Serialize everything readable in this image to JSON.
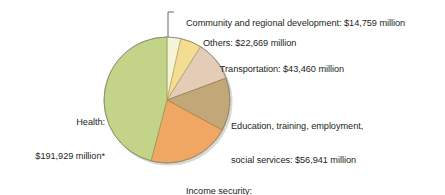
{
  "figure": {
    "type": "pie-chart-figure",
    "background_color": "#ffffff",
    "text_color": "#231f20"
  },
  "chart_data": {
    "type": "pie",
    "title": "",
    "subtitle": "",
    "xlabel": "",
    "ylabel": "",
    "units": "million",
    "currency": "$",
    "total": 418091,
    "legend_position": "callout-labels",
    "grid": false,
    "start_angle_deg": 0,
    "direction": "clockwise",
    "categories": [
      "Community and regional development",
      "Others",
      "Transportation",
      "Education, training, employment, social services",
      "Income security",
      "Health"
    ],
    "values": [
      14759,
      22669,
      43460,
      56941,
      88333,
      191929
    ],
    "colors": [
      "#f5f3d8",
      "#f2dd92",
      "#e3cdb6",
      "#c2a878",
      "#f0a763",
      "#c3d488"
    ],
    "slices": [
      {
        "name": "community-and-regional-development",
        "label_line1": "Community and regional development: $14,759 million",
        "label_line2": "",
        "value": 14759,
        "value_text": "$14,759 million",
        "percent": 3.5,
        "angle_deg": 12.71,
        "color": "#f5f3d8"
      },
      {
        "name": "others",
        "label_line1": "Others: $22,669 million",
        "label_line2": "",
        "value": 22669,
        "value_text": "$22,669 million",
        "percent": 5.4,
        "angle_deg": 19.52,
        "color": "#f2dd92"
      },
      {
        "name": "transportation",
        "label_line1": "Transportation: $43,460 million",
        "label_line2": "",
        "value": 43460,
        "value_text": "$43,460 million",
        "percent": 10.4,
        "angle_deg": 37.43,
        "color": "#e3cdb6"
      },
      {
        "name": "education-training-employment-social-services",
        "label_line1": "Education, training, employment,",
        "label_line2": "social services: $56,941 million",
        "value": 56941,
        "value_text": "$56,941 million",
        "percent": 13.6,
        "angle_deg": 49.04,
        "color": "#c2a878"
      },
      {
        "name": "income-security",
        "label_line1": "Income security:",
        "label_line2": "$88,333 million",
        "value": 88333,
        "value_text": "$88,333 million",
        "percent": 21.1,
        "angle_deg": 76.08,
        "color": "#f0a763"
      },
      {
        "name": "health",
        "label_line1": "Health:",
        "label_line2": "$191,929 million*",
        "value": 191929,
        "value_text": "$191,929 million*",
        "percent": 45.9,
        "angle_deg": 165.23,
        "color": "#c3d488"
      }
    ]
  },
  "labels": {
    "community": "Community and regional development: $14,759 million",
    "others": "Others: $22,669 million",
    "transportation": "Transportation: $43,460 million",
    "education_line1": "Education, training, employment,",
    "education_line2": "social services: $56,941 million",
    "income_line1": "Income security:",
    "income_line2": "$88,333 million",
    "health_line1": "Health:",
    "health_line2": "$191,929 million*"
  }
}
